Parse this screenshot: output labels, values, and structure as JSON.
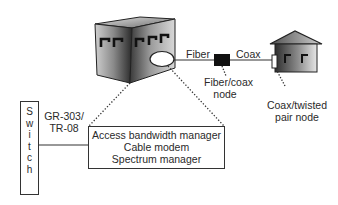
{
  "diagram": {
    "type": "network-architecture",
    "nodes": {
      "headend": {
        "label": "",
        "shape": "shaded-cube-building"
      },
      "fiber_coax_node": {
        "label_line1": "Fiber/coax",
        "label_line2": "node",
        "shape": "black-square"
      },
      "coax_twisted_pair_node": {
        "label_line1": "Coax/twisted",
        "label_line2": "pair node",
        "shape": "house"
      },
      "switch": {
        "label": "Switch",
        "letters": [
          "S",
          "w",
          "i",
          "t",
          "c",
          "h"
        ],
        "shape": "vertical-rectangle"
      },
      "access_box": {
        "lines": [
          "Access bandwidth manager",
          "Cable modem",
          "Spectrum manager"
        ],
        "shape": "rectangle"
      }
    },
    "links": {
      "fiber": {
        "label": "Fiber",
        "from": "headend",
        "to": "fiber_coax_node"
      },
      "coax": {
        "label": "Coax",
        "from": "fiber_coax_node",
        "to": "coax_twisted_pair_node"
      },
      "interface": {
        "label_line1": "GR-303/",
        "label_line2": "TR-08",
        "from": "switch",
        "to": "access_box"
      }
    },
    "colors": {
      "line": "#333333",
      "node_fill": "#111111",
      "background": "#ffffff"
    }
  }
}
